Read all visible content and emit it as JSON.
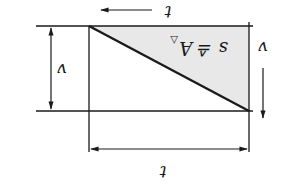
{
  "diagram": {
    "orientation": "rotated 180°",
    "formula": "s ≙ A",
    "formula_subscript": "△",
    "labels": {
      "time_top": "t",
      "time_bottom": "t",
      "velocity_left": "v",
      "velocity_right": "v"
    },
    "colors": {
      "line": "#1a1a1a",
      "fill": "#e8e8e8",
      "background": "#ffffff"
    }
  }
}
